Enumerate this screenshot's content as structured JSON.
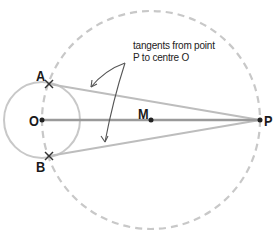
{
  "diagram": {
    "annotation": {
      "line1": "tangents from point",
      "line2": "P to centre O"
    },
    "points": {
      "A": {
        "label": "A",
        "x": 49,
        "y": 84
      },
      "B": {
        "label": "B",
        "x": 49,
        "y": 156
      },
      "O": {
        "label": "O",
        "x": 42,
        "y": 120
      },
      "M": {
        "label": "M",
        "x": 151,
        "y": 120
      },
      "P": {
        "label": "P",
        "x": 260,
        "y": 120
      }
    },
    "circles": {
      "small": {
        "center": "O",
        "radius": 38,
        "style": "solid",
        "color": "#c8c8c8"
      },
      "large": {
        "center": "M",
        "radius": 109,
        "style": "dashed",
        "color": "#c8c8c8"
      }
    },
    "colors": {
      "center_line": "#9a9a9a",
      "tangent": "#bdbdbd",
      "arrow": "#555555",
      "text": "#1a1a1a"
    }
  }
}
